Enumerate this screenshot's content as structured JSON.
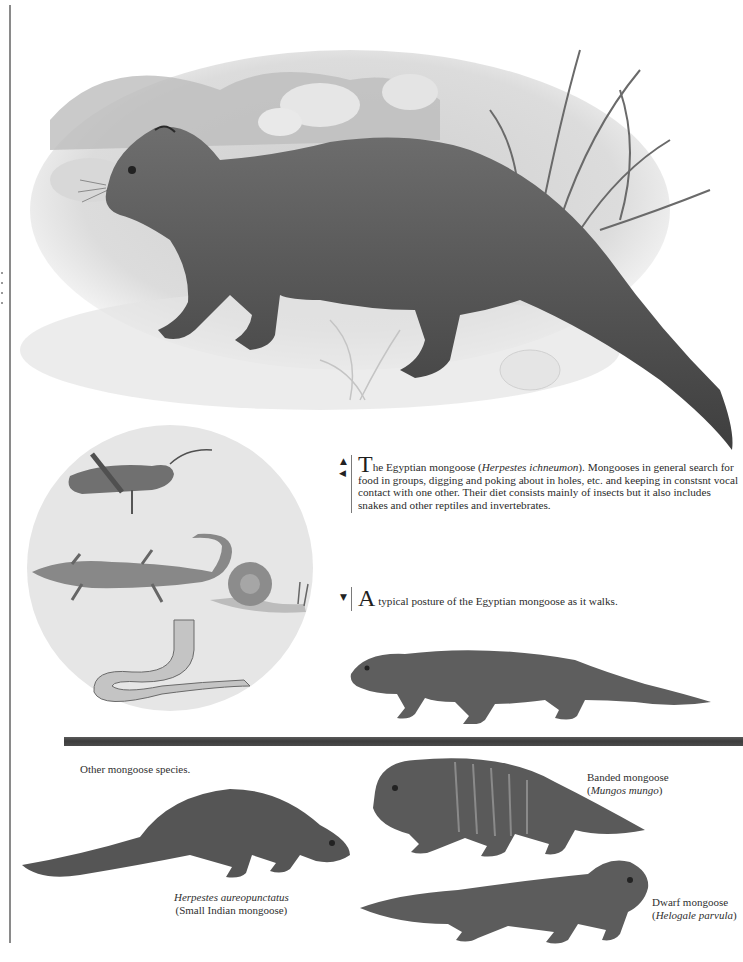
{
  "page": {
    "margin_rule": true
  },
  "illustrations": {
    "hero": {
      "subject": "Egyptian mongoose walking among rocks and grass",
      "tone": "grayscale"
    },
    "prey_circle": {
      "subject": "Prey items: grasshopper, lizard, snail, worm",
      "items": [
        "grasshopper",
        "lizard",
        "snail",
        "worm"
      ]
    },
    "walking": {
      "subject": "Egyptian mongoose typical walking posture"
    },
    "banded": {
      "subject": "Banded mongoose"
    },
    "small_indian": {
      "subject": "Small Indian mongoose"
    },
    "dwarf": {
      "subject": "Dwarf mongoose"
    }
  },
  "caption_main": {
    "arrows": [
      "▲",
      "◀"
    ],
    "dropcap": "T",
    "lead": "he Egyptian mongoose (",
    "species_italic": "Herpestes ichneumon",
    "rest": "). Mongooses in general search for food in groups, digging and poking about in holes, etc. and keeping in constsnt vocal contact with one other. Their diet consists mainly of insects but it also includes snakes and other reptiles and invertebrates."
  },
  "caption_walk": {
    "arrows": [
      "▼"
    ],
    "dropcap": "A",
    "text": " typical posture of the Egyptian mongoose as it walks."
  },
  "other_species": {
    "heading": "Other mongoose species.",
    "banded": {
      "common": "Banded mongoose",
      "open": "(",
      "latin": "Mungos mungo",
      "close": ")"
    },
    "small_indian": {
      "latin": "Herpestes aureopunctatus",
      "common": "(Small Indian mongoose)"
    },
    "dwarf": {
      "common": "Dwarf mongoose",
      "open": "(",
      "latin": "Helogale parvula",
      "close": ")"
    }
  },
  "colors": {
    "ink": "#2a2a2a",
    "separator": "#454545",
    "rule": "#8a8a8a"
  }
}
